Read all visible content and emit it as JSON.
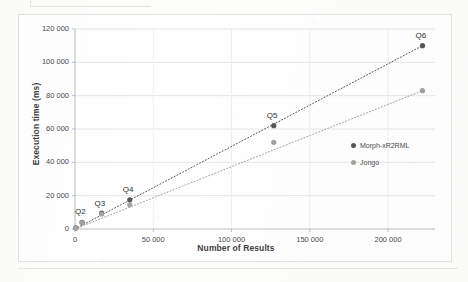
{
  "chart_data": {
    "type": "scatter",
    "title": "",
    "xlabel": "Number of Results",
    "ylabel": "Execution time (ms)",
    "xlim": [
      0,
      230000
    ],
    "ylim": [
      0,
      120000
    ],
    "grid": true,
    "legend_position": "inside-right",
    "x_ticks": [
      "0",
      "50 000",
      "100 000",
      "150 000",
      "200 000"
    ],
    "x_tick_values": [
      0,
      50000,
      100000,
      150000,
      200000
    ],
    "y_ticks": [
      "0",
      "20 000",
      "40 000",
      "60 000",
      "80 000",
      "100 000",
      "120 000"
    ],
    "y_tick_values": [
      0,
      20000,
      40000,
      60000,
      80000,
      100000,
      120000
    ],
    "point_labels": [
      {
        "text": "Q2",
        "x": 4500,
        "y": 4000
      },
      {
        "text": "Q3",
        "x": 17000,
        "y": 9000
      },
      {
        "text": "Q4",
        "x": 35000,
        "y": 17500
      },
      {
        "text": "Q5",
        "x": 127000,
        "y": 62000
      },
      {
        "text": "Q6",
        "x": 222000,
        "y": 110000
      }
    ],
    "series": [
      {
        "name": "Morph-xR2RML",
        "color": "#585858",
        "x": [
          500,
          4500,
          17000,
          35000,
          127000,
          222000
        ],
        "values": [
          700,
          4000,
          9500,
          17500,
          62000,
          110000
        ],
        "trendline": {
          "x0": 0,
          "y0": 0,
          "x1": 222000,
          "y1": 110000
        }
      },
      {
        "name": "Jongo",
        "color": "#a2a2a2",
        "x": [
          500,
          4500,
          17000,
          35000,
          127000,
          222000
        ],
        "values": [
          500,
          3800,
          9000,
          14500,
          52000,
          83000
        ],
        "trendline": {
          "x0": 0,
          "y0": 0,
          "x1": 222000,
          "y1": 83000
        }
      }
    ]
  },
  "legend": {
    "items": [
      {
        "label": "Morph-xR2RML"
      },
      {
        "label": "Jongo"
      }
    ]
  }
}
